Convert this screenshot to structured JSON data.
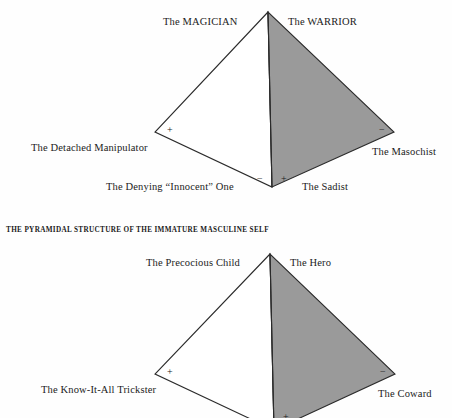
{
  "document": {
    "title": "The Pyramidal Structure of the Immature Masculine Self",
    "caption": "THE PYRAMIDAL STRUCTURE OF THE IMMATURE MASCULINE SELF"
  },
  "colors": {
    "shaded_face": "#9a9a9a",
    "outline": "#2b2b2b",
    "unshaded_face": "#ffffff",
    "text": "#1b1b1b",
    "page_background": "#fefefe"
  },
  "figures": [
    {
      "id": "pyramid-magician-warrior",
      "name": "Upper pyramid",
      "apex_label_left": "The MAGICIAN",
      "apex_label_right": "The WARRIOR",
      "labels": {
        "top_left": "The MAGICIAN",
        "top_right": "The WARRIOR",
        "left": "The Detached Manipulator",
        "right": "The Masochist",
        "bottom_left": "The Denying “Innocent” One",
        "bottom_right": "The Sadist"
      },
      "polarity_marks": [
        {
          "id": "left-vertex-plus",
          "symbol": "+",
          "at": "left vertex"
        },
        {
          "id": "right-vertex-minus",
          "symbol": "−",
          "at": "right vertex"
        },
        {
          "id": "front-vertex-minus",
          "symbol": "−",
          "at": "front vertex, left side"
        },
        {
          "id": "front-vertex-plus",
          "symbol": "+",
          "at": "front vertex, right side"
        }
      ]
    },
    {
      "id": "pyramid-precocious-hero",
      "name": "Lower pyramid",
      "apex_label_left": "The Precocious Child",
      "apex_label_right": "The Hero",
      "labels": {
        "top_left": "The Precocious Child",
        "top_right": "The Hero",
        "left": "The Know-It-All Trickster",
        "right": "The Coward"
      },
      "polarity_marks": [
        {
          "id": "left-vertex-plus",
          "symbol": "+",
          "at": "left vertex"
        },
        {
          "id": "right-vertex-minus",
          "symbol": "−",
          "at": "right vertex"
        },
        {
          "id": "front-vertex-plus",
          "symbol": "+",
          "at": "front vertex, clipped by page edge"
        }
      ]
    }
  ]
}
